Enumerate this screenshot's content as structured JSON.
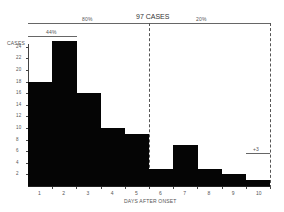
{
  "chart_data": {
    "type": "bar",
    "title": "97 CASES",
    "xlabel": "DAYS AFTER ONSET",
    "ylabel": "CASES",
    "categories": [
      "1",
      "2",
      "3",
      "4",
      "5",
      "6",
      "7",
      "8",
      "9",
      "10"
    ],
    "values": [
      18,
      25,
      16,
      10,
      9,
      3,
      7,
      3,
      2,
      1
    ],
    "yticks": [
      2,
      4,
      6,
      8,
      10,
      12,
      14,
      16,
      18,
      20,
      22,
      24
    ],
    "ylim": [
      0,
      26
    ],
    "annotations": [
      {
        "text": "80%",
        "span": "days 1-5"
      },
      {
        "text": "20%",
        "span": "days 6-10+"
      },
      {
        "text": "44%",
        "span": "days 1-2"
      },
      {
        "text": "+3",
        "note": "cases beyond day 10"
      }
    ],
    "grid": false,
    "legend": null
  },
  "labels": {
    "title": "97 CASES",
    "pct80": "80%",
    "pct20": "20%",
    "pct44": "44%",
    "extra": "+3",
    "ylabel": "CASES",
    "xlabel": "DAYS AFTER ONSET"
  }
}
